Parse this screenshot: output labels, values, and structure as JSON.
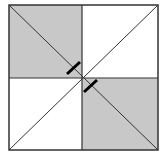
{
  "diagram": {
    "type": "geometry-figure",
    "square": {
      "x": 9,
      "y": 5,
      "width": 149,
      "height": 145
    },
    "center": {
      "x": 82,
      "y": 78
    },
    "shaded_quadrants": [
      "top-left",
      "bottom-right"
    ],
    "colors": {
      "shade": "#c8c8c8",
      "stroke": "#333333",
      "tick": "#000000",
      "background": "#ffffff"
    },
    "tick_marks": [
      {
        "x1": 67,
        "y1": 74,
        "x2": 80,
        "y2": 62
      },
      {
        "x1": 84,
        "y1": 92,
        "x2": 97,
        "y2": 80
      }
    ]
  }
}
